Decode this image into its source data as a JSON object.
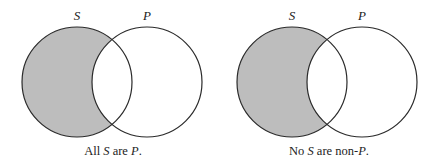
{
  "colors": {
    "shade": "#bdbdbd",
    "stroke": "#2a2a2a",
    "background": "#ffffff"
  },
  "diagrams": [
    {
      "set_s_label": "S",
      "set_p_label": "P",
      "caption": {
        "part1": "All ",
        "s": "S",
        "part2": " are ",
        "p": "P",
        "part3": "."
      },
      "shaded_region": "S minus P"
    },
    {
      "set_s_label": "S",
      "set_p_label": "P",
      "caption": {
        "part1": "No ",
        "s": "S",
        "part2": " are non-",
        "p": "P",
        "part3": "."
      },
      "shaded_region": "S minus P"
    }
  ]
}
